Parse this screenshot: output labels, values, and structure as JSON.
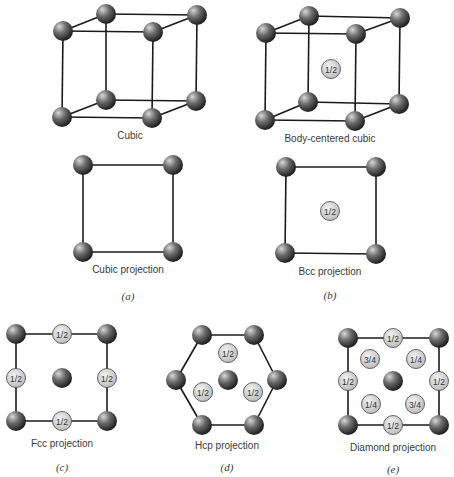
{
  "colors": {
    "atom_highlight": "#d8d8d8",
    "atom_mid": "#6e6e6e",
    "atom_dark": "#1c1c1c",
    "frac_fill_light": "#f2f2f2",
    "frac_fill_dark": "#b9b9b9",
    "frac_stroke": "#555555",
    "edge": "#1a1a1a"
  },
  "atom_radius": 10,
  "frac_radius": 9.5,
  "figures": [
    {
      "id": "cubic",
      "label": "Cubic",
      "label_pos": [
        130,
        139
      ],
      "edges": [
        [
          [
            63,
            31
          ],
          [
            153,
            32
          ]
        ],
        [
          [
            106,
            14
          ],
          [
            197,
            15
          ]
        ],
        [
          [
            63,
            31
          ],
          [
            106,
            14
          ]
        ],
        [
          [
            153,
            32
          ],
          [
            197,
            15
          ]
        ],
        [
          [
            62,
            117
          ],
          [
            152,
            118
          ]
        ],
        [
          [
            106,
            100
          ],
          [
            196,
            101
          ]
        ],
        [
          [
            62,
            117
          ],
          [
            106,
            100
          ]
        ],
        [
          [
            152,
            118
          ],
          [
            196,
            101
          ]
        ],
        [
          [
            63,
            31
          ],
          [
            62,
            117
          ]
        ],
        [
          [
            153,
            32
          ],
          [
            152,
            118
          ]
        ],
        [
          [
            106,
            14
          ],
          [
            106,
            100
          ]
        ],
        [
          [
            197,
            15
          ],
          [
            196,
            101
          ]
        ]
      ],
      "atoms": [
        [
          106,
          14
        ],
        [
          197,
          15
        ],
        [
          106,
          100
        ],
        [
          196,
          101
        ],
        [
          63,
          31
        ],
        [
          153,
          32
        ],
        [
          62,
          117
        ],
        [
          152,
          118
        ]
      ],
      "fracs": []
    },
    {
      "id": "bcc",
      "label": "Body-centered cubic",
      "label_pos": [
        330,
        142
      ],
      "edges": [
        [
          [
            266,
            33
          ],
          [
            356,
            34
          ]
        ],
        [
          [
            309,
            16
          ],
          [
            400,
            18
          ]
        ],
        [
          [
            266,
            33
          ],
          [
            309,
            16
          ]
        ],
        [
          [
            356,
            34
          ],
          [
            400,
            18
          ]
        ],
        [
          [
            265,
            120
          ],
          [
            355,
            121
          ]
        ],
        [
          [
            308,
            102
          ],
          [
            399,
            104
          ]
        ],
        [
          [
            265,
            120
          ],
          [
            308,
            102
          ]
        ],
        [
          [
            355,
            121
          ],
          [
            399,
            104
          ]
        ],
        [
          [
            266,
            33
          ],
          [
            265,
            120
          ]
        ],
        [
          [
            356,
            34
          ],
          [
            355,
            121
          ]
        ],
        [
          [
            309,
            16
          ],
          [
            308,
            102
          ]
        ],
        [
          [
            400,
            18
          ],
          [
            399,
            104
          ]
        ]
      ],
      "atoms": [
        [
          309,
          16
        ],
        [
          400,
          18
        ],
        [
          308,
          102
        ],
        [
          399,
          104
        ],
        [
          266,
          33
        ],
        [
          356,
          34
        ],
        [
          265,
          120
        ],
        [
          355,
          121
        ]
      ],
      "fracs": [
        {
          "pos": [
            331,
            69
          ],
          "text": "1/2"
        }
      ]
    },
    {
      "id": "cubic-projection",
      "label": "Cubic projection",
      "label_pos": [
        128,
        273
      ],
      "panel": "(a)",
      "panel_pos": [
        128,
        300
      ],
      "edges": [
        [
          [
            83,
            165
          ],
          [
            173,
            165
          ]
        ],
        [
          [
            173,
            165
          ],
          [
            173,
            252
          ]
        ],
        [
          [
            173,
            252
          ],
          [
            83,
            252
          ]
        ],
        [
          [
            83,
            252
          ],
          [
            83,
            165
          ]
        ]
      ],
      "atoms": [
        [
          83,
          165
        ],
        [
          173,
          165
        ],
        [
          83,
          252
        ],
        [
          173,
          252
        ]
      ],
      "fracs": []
    },
    {
      "id": "bcc-projection",
      "label": "Bcc projection",
      "label_pos": [
        330,
        275
      ],
      "panel": "(b)",
      "panel_pos": [
        330,
        299
      ],
      "edges": [
        [
          [
            286,
            167
          ],
          [
            376,
            167
          ]
        ],
        [
          [
            376,
            167
          ],
          [
            376,
            254
          ]
        ],
        [
          [
            376,
            254
          ],
          [
            285,
            253
          ]
        ],
        [
          [
            285,
            253
          ],
          [
            286,
            167
          ]
        ]
      ],
      "atoms": [
        [
          286,
          167
        ],
        [
          376,
          167
        ],
        [
          285,
          253
        ],
        [
          376,
          254
        ]
      ],
      "fracs": [
        {
          "pos": [
            330,
            211
          ],
          "text": "1/2"
        }
      ]
    },
    {
      "id": "fcc-projection",
      "label": "Fcc projection",
      "label_pos": [
        62,
        447
      ],
      "panel": "(c)",
      "panel_pos": [
        62,
        471
      ],
      "edges": [
        [
          [
            16,
            334
          ],
          [
            107,
            334
          ]
        ],
        [
          [
            107,
            334
          ],
          [
            107,
            421
          ]
        ],
        [
          [
            107,
            421
          ],
          [
            16,
            421
          ]
        ],
        [
          [
            16,
            421
          ],
          [
            16,
            334
          ]
        ]
      ],
      "atoms": [
        [
          16,
          334
        ],
        [
          107,
          334
        ],
        [
          16,
          421
        ],
        [
          107,
          421
        ],
        [
          62,
          378
        ]
      ],
      "fracs": [
        {
          "pos": [
            62,
            334
          ],
          "text": "1/2"
        },
        {
          "pos": [
            16,
            378
          ],
          "text": "1/2"
        },
        {
          "pos": [
            107,
            378
          ],
          "text": "1/2"
        },
        {
          "pos": [
            62,
            421
          ],
          "text": "1/2"
        }
      ]
    },
    {
      "id": "hcp-projection",
      "label": "Hcp projection",
      "label_pos": [
        227,
        449
      ],
      "panel": "(d)",
      "panel_pos": [
        227,
        471
      ],
      "edges": [
        [
          [
            202,
            335
          ],
          [
            254,
            335
          ]
        ],
        [
          [
            254,
            335
          ],
          [
            277,
            380
          ]
        ],
        [
          [
            277,
            380
          ],
          [
            254,
            425
          ]
        ],
        [
          [
            254,
            425
          ],
          [
            202,
            425
          ]
        ],
        [
          [
            202,
            425
          ],
          [
            176,
            380
          ]
        ],
        [
          [
            176,
            380
          ],
          [
            202,
            335
          ]
        ]
      ],
      "atoms": [
        [
          202,
          335
        ],
        [
          254,
          335
        ],
        [
          277,
          380
        ],
        [
          254,
          425
        ],
        [
          202,
          425
        ],
        [
          176,
          380
        ],
        [
          228,
          380
        ]
      ],
      "fracs": [
        {
          "pos": [
            228,
            353
          ],
          "text": "1/2"
        },
        {
          "pos": [
            203,
            392
          ],
          "text": "1/2"
        },
        {
          "pos": [
            253,
            392
          ],
          "text": "1/2"
        }
      ]
    },
    {
      "id": "diamond-projection",
      "label": "Diamond projection",
      "label_pos": [
        393,
        451
      ],
      "panel": "(e)",
      "panel_pos": [
        393,
        473
      ],
      "edges": [
        [
          [
            348,
            338
          ],
          [
            439,
            338
          ]
        ],
        [
          [
            439,
            338
          ],
          [
            439,
            425
          ]
        ],
        [
          [
            439,
            425
          ],
          [
            348,
            425
          ]
        ],
        [
          [
            348,
            425
          ],
          [
            348,
            338
          ]
        ]
      ],
      "atoms": [
        [
          348,
          338
        ],
        [
          439,
          338
        ],
        [
          348,
          425
        ],
        [
          439,
          425
        ],
        [
          393,
          381
        ]
      ],
      "fracs": [
        {
          "pos": [
            393,
            338
          ],
          "text": "1/2"
        },
        {
          "pos": [
            348,
            381
          ],
          "text": "1/2"
        },
        {
          "pos": [
            439,
            381
          ],
          "text": "1/2"
        },
        {
          "pos": [
            393,
            425
          ],
          "text": "1/2"
        },
        {
          "pos": [
            370,
            359
          ],
          "text": "3/4"
        },
        {
          "pos": [
            416,
            359
          ],
          "text": "1/4"
        },
        {
          "pos": [
            371,
            404
          ],
          "text": "1/4"
        },
        {
          "pos": [
            415,
            404
          ],
          "text": "3/4"
        }
      ]
    }
  ]
}
